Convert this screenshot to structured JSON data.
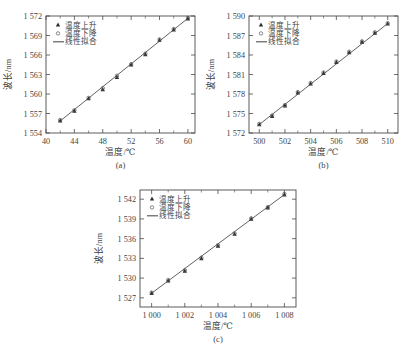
{
  "figure": {
    "background_color": "#ffffff",
    "line_color": "#4f4f4f",
    "marker_color": "#2e2e2e",
    "axis_color": "#4a4a4a"
  },
  "legend": {
    "rising_label": "温度上升",
    "falling_label": "温度下降",
    "fit_label": "线性拟合",
    "rising_marker": "triangle-up-icon",
    "falling_marker": "circle-open-icon",
    "fit_marker": "solid-line-icon"
  },
  "panels": [
    {
      "caption": "(a)",
      "name": "panel-a"
    },
    {
      "caption": "(b)",
      "name": "panel-b"
    },
    {
      "caption": "(c)",
      "name": "panel-c"
    }
  ],
  "chart_data": [
    {
      "type": "scatter",
      "title": "",
      "caption": "(a)",
      "xlabel": "温度/℃",
      "ylabel": "波长/nm",
      "xlim": [
        40,
        61
      ],
      "ylim": [
        1554,
        1572
      ],
      "xticks": [
        40,
        44,
        48,
        52,
        56,
        60
      ],
      "xtick_labels": [
        "40",
        "44",
        "48",
        "52",
        "56",
        "60"
      ],
      "xminor_step": 2,
      "yticks": [
        1554,
        1557,
        1560,
        1563,
        1566,
        1569,
        1572
      ],
      "ytick_labels": [
        "1 554",
        "1 557",
        "1 560",
        "1 563",
        "1 566",
        "1 569",
        "1 572"
      ],
      "grid": false,
      "legend_position": "top-left",
      "x": [
        42,
        44,
        46,
        48,
        50,
        52,
        54,
        56,
        58,
        60
      ],
      "series": [
        {
          "name": "温度上升",
          "marker": "triangle-up-icon",
          "values": [
            1555.9,
            1557.4,
            1559.3,
            1560.7,
            1562.6,
            1564.5,
            1566.1,
            1568.3,
            1569.9,
            1571.6
          ]
        },
        {
          "name": "温度下降",
          "marker": "circle-open-icon",
          "values": [
            1556.0,
            1557.5,
            1559.4,
            1560.9,
            1562.8,
            1564.6,
            1566.2,
            1568.4,
            1570.0,
            1571.7
          ]
        }
      ],
      "fit": {
        "name": "线性拟合",
        "x0": 42,
        "y0": 1555.85,
        "x1": 60,
        "y1": 1571.65
      }
    },
    {
      "type": "scatter",
      "title": "",
      "caption": "(b)",
      "xlabel": "温度/℃",
      "ylabel": "波长/nm",
      "xlim": [
        499.2,
        510.8
      ],
      "ylim": [
        1572,
        1590
      ],
      "xticks": [
        500,
        502,
        504,
        506,
        508,
        510
      ],
      "xtick_labels": [
        "500",
        "502",
        "504",
        "506",
        "508",
        "510"
      ],
      "xminor_step": 1,
      "yticks": [
        1572,
        1575,
        1578,
        1581,
        1584,
        1587,
        1590
      ],
      "ytick_labels": [
        "1 572",
        "1 575",
        "1 578",
        "1 581",
        "1 584",
        "1 587",
        "1 590"
      ],
      "grid": false,
      "legend_position": "top-left",
      "x": [
        500,
        501,
        502,
        503,
        504,
        505,
        506,
        507,
        508,
        509,
        510
      ],
      "series": [
        {
          "name": "温度上升",
          "marker": "triangle-up-icon",
          "values": [
            1573.3,
            1574.6,
            1576.2,
            1578.2,
            1579.6,
            1581.2,
            1582.9,
            1584.4,
            1586.0,
            1587.4,
            1588.8
          ]
        },
        {
          "name": "温度下降",
          "marker": "circle-open-icon",
          "values": [
            1573.4,
            1574.7,
            1576.3,
            1578.3,
            1579.7,
            1581.3,
            1583.0,
            1584.5,
            1586.1,
            1587.5,
            1588.9
          ]
        }
      ],
      "fit": {
        "name": "线性拟合",
        "x0": 500,
        "y0": 1573.3,
        "x1": 510,
        "y1": 1588.85
      }
    },
    {
      "type": "scatter",
      "title": "",
      "caption": "(c)",
      "xlabel": "温度/℃",
      "ylabel": "波长/nm",
      "xlim": [
        999.3,
        1008.7
      ],
      "ylim": [
        1525.6,
        1543.4
      ],
      "xticks": [
        1000,
        1002,
        1004,
        1006,
        1008
      ],
      "xtick_labels": [
        "1 000",
        "1 002",
        "1 004",
        "1 006",
        "1 008"
      ],
      "xminor_step": 1,
      "yticks": [
        1527,
        1530,
        1533,
        1536,
        1539,
        1542
      ],
      "ytick_labels": [
        "1 527",
        "1 530",
        "1 533",
        "1 536",
        "1 539",
        "1 542"
      ],
      "grid": false,
      "legend_position": "top-left",
      "x": [
        1000,
        1001,
        1002,
        1003,
        1004,
        1005,
        1006,
        1007,
        1008
      ],
      "series": [
        {
          "name": "温度上升",
          "marker": "triangle-up-icon",
          "values": [
            1527.7,
            1529.6,
            1531.1,
            1533.0,
            1534.9,
            1536.7,
            1539.0,
            1540.7,
            1542.7
          ]
        },
        {
          "name": "温度下降",
          "marker": "circle-open-icon",
          "values": [
            1527.8,
            1529.7,
            1531.2,
            1533.1,
            1535.0,
            1536.8,
            1539.1,
            1540.8,
            1542.8
          ]
        }
      ],
      "fit": {
        "name": "线性拟合",
        "x0": 1000,
        "y0": 1527.7,
        "x1": 1008,
        "y1": 1542.7
      }
    }
  ]
}
